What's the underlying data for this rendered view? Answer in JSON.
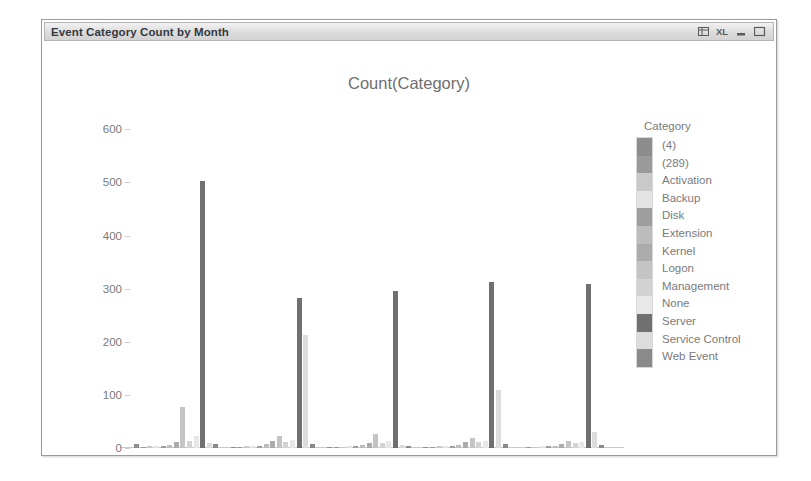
{
  "window": {
    "title": "Event Category Count by Month",
    "controls": [
      {
        "name": "table-view-icon",
        "label": "Table view"
      },
      {
        "name": "excel-export-icon",
        "label": "XL"
      },
      {
        "name": "minimize-icon",
        "label": "Minimize"
      },
      {
        "name": "maximize-icon",
        "label": "Maximize"
      }
    ]
  },
  "legend": {
    "title": "Category"
  },
  "chart_data": {
    "type": "bar",
    "title": "Count(Category)",
    "xlabel": "=Month(Date)",
    "ylabel": "",
    "ylim": [
      0,
      640
    ],
    "yticks": [
      0,
      100,
      200,
      300,
      400,
      500,
      600
    ],
    "grid": false,
    "legend_position": "right",
    "legend_title": "Category",
    "categories": [
      "Mar",
      "Feb",
      "Jan",
      "Dec",
      "Nov"
    ],
    "series": [
      {
        "name": "(4)",
        "color": "#8d8d8d",
        "values": [
          8,
          2,
          1,
          2,
          0
        ]
      },
      {
        "name": "(289)",
        "color": "#9a9a9a",
        "values": [
          1,
          1,
          1,
          1,
          1
        ]
      },
      {
        "name": "Activation",
        "color": "#c9c9c9",
        "values": [
          3,
          3,
          2,
          3,
          2
        ]
      },
      {
        "name": "Backup",
        "color": "#e3e3e3",
        "values": [
          4,
          4,
          3,
          4,
          3
        ]
      },
      {
        "name": "Disk",
        "color": "#9e9e9e",
        "values": [
          4,
          4,
          3,
          4,
          3
        ]
      },
      {
        "name": "Extension",
        "color": "#bcbcbc",
        "values": [
          6,
          7,
          5,
          6,
          4
        ]
      },
      {
        "name": "Kernel",
        "color": "#ababab",
        "values": [
          11,
          13,
          9,
          11,
          8
        ]
      },
      {
        "name": "Logon",
        "color": "#c4c4c4",
        "values": [
          78,
          22,
          26,
          18,
          14
        ]
      },
      {
        "name": "Management",
        "color": "#d3d3d3",
        "values": [
          14,
          12,
          10,
          11,
          9
        ]
      },
      {
        "name": "None",
        "color": "#e8e8e8",
        "values": [
          22,
          16,
          14,
          14,
          11
        ]
      },
      {
        "name": "Server",
        "color": "#707070",
        "values": [
          503,
          283,
          296,
          312,
          308
        ]
      },
      {
        "name": "Service Control",
        "color": "#dcdcdc",
        "values": [
          10,
          212,
          6,
          110,
          30
        ]
      },
      {
        "name": "Web Event",
        "color": "#8a8a8a",
        "values": [
          7,
          8,
          4,
          7,
          5
        ]
      }
    ]
  }
}
